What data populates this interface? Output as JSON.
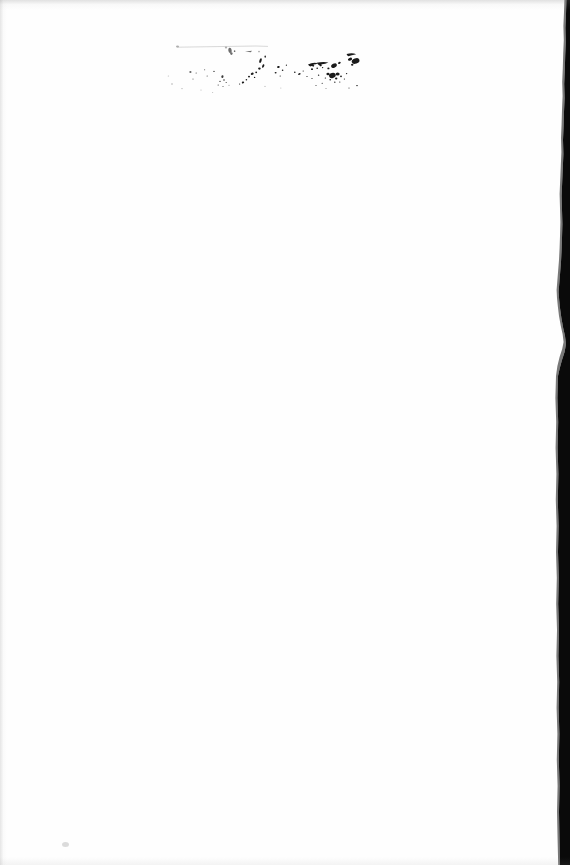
{
  "document": {
    "kind": "scanned-page",
    "page_label": "",
    "body_text": "",
    "is_blank": true,
    "background_color": "#fefefe",
    "ink_color": "#1a1a1a",
    "scan_edge_color": "#0a0a0a"
  },
  "page": {
    "width": 570,
    "height": 865
  },
  "artifacts": {
    "ink_cluster": {
      "label": "ink smudge cluster",
      "region_description": "scattered ink blots and speckles across the upper area of the page"
    },
    "ruled_line": {
      "label": "faint horizontal rule"
    },
    "scan_edge": {
      "label": "dark scanner edge band along right margin"
    },
    "stray_speck": {
      "label": "stray speck near lower left"
    },
    "edge_shadows": {
      "top": "top edge shadow",
      "left": "left edge shadow",
      "bottom": "bottom edge shadow"
    }
  }
}
